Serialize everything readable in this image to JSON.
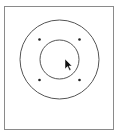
{
  "diagram": {
    "stroke_color": "#555555",
    "frame_color": "#8a8a8a",
    "dot_color": "#222222",
    "cursor_color": "#111111",
    "circles": [
      {
        "name": "outer-circle"
      },
      {
        "name": "inner-circle"
      }
    ],
    "dots": [
      {
        "name": "dot-top-left"
      },
      {
        "name": "dot-top-right"
      },
      {
        "name": "dot-bottom-left"
      },
      {
        "name": "dot-bottom-right"
      }
    ]
  }
}
